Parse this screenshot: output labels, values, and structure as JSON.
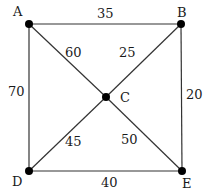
{
  "graph": {
    "nodes": [
      {
        "id": "A",
        "label": "A",
        "x": 29,
        "y": 24,
        "lx": 13,
        "ly": 16
      },
      {
        "id": "B",
        "label": "B",
        "x": 181,
        "y": 24,
        "lx": 177,
        "ly": 17
      },
      {
        "id": "C",
        "label": "C",
        "x": 106,
        "y": 97,
        "lx": 120,
        "ly": 102
      },
      {
        "id": "D",
        "label": "D",
        "x": 29,
        "y": 171,
        "lx": 12,
        "ly": 186
      },
      {
        "id": "E",
        "label": "E",
        "x": 182,
        "y": 171,
        "lx": 182,
        "ly": 188
      }
    ],
    "edges": [
      {
        "from": "A",
        "to": "B",
        "weight": "35",
        "lx": 97,
        "ly": 18
      },
      {
        "from": "A",
        "to": "D",
        "weight": "70",
        "lx": 8,
        "ly": 96
      },
      {
        "from": "B",
        "to": "E",
        "weight": "20",
        "lx": 186,
        "ly": 99
      },
      {
        "from": "D",
        "to": "E",
        "weight": "40",
        "lx": 101,
        "ly": 187
      },
      {
        "from": "A",
        "to": "C",
        "weight": "60",
        "lx": 65,
        "ly": 57
      },
      {
        "from": "B",
        "to": "C",
        "weight": "25",
        "lx": 119,
        "ly": 57
      },
      {
        "from": "D",
        "to": "C",
        "weight": "45",
        "lx": 65,
        "ly": 146
      },
      {
        "from": "E",
        "to": "C",
        "weight": "50",
        "lx": 121,
        "ly": 144
      }
    ]
  }
}
